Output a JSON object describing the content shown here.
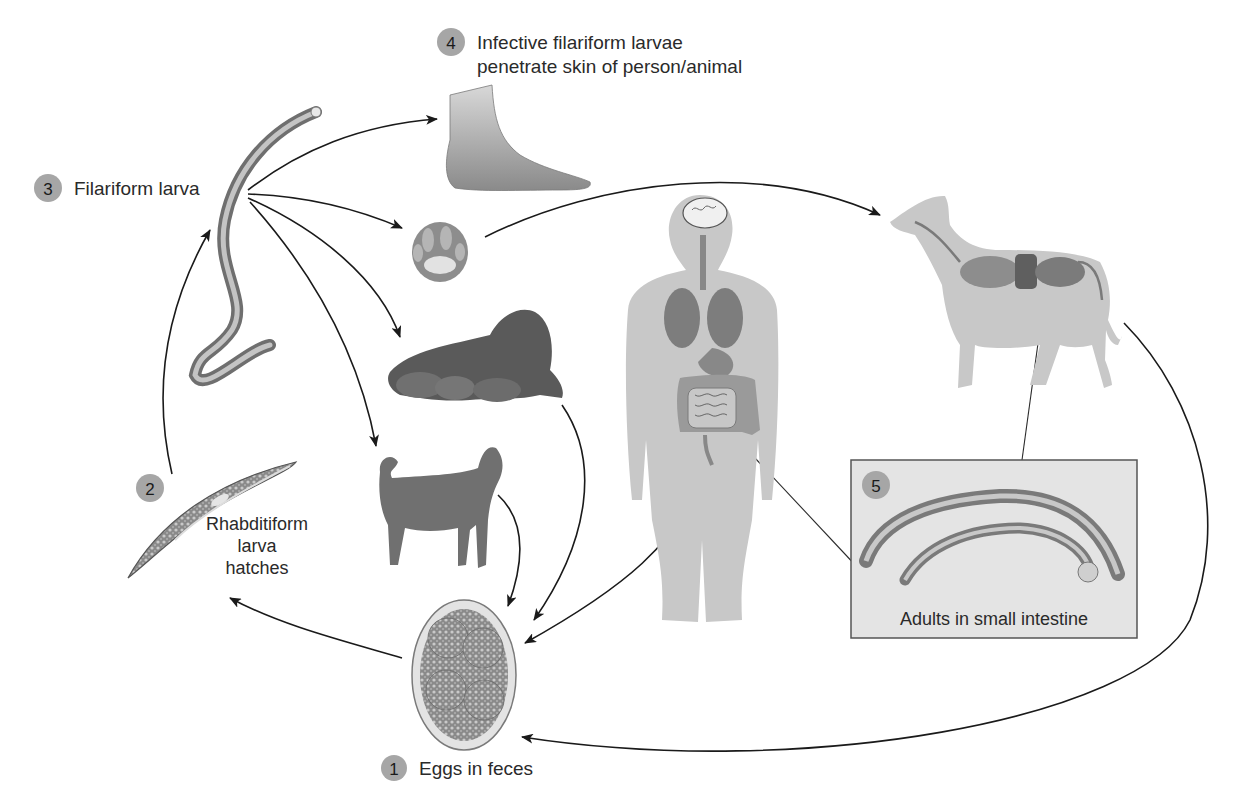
{
  "figure": {
    "colors": {
      "badge": "#a6a6a6",
      "arrow": "#1a1a1a",
      "inset_bg": "#e4e4e4",
      "silhouette": "#c8c8c8",
      "organs": "#7a7a7a"
    }
  },
  "stages": [
    {
      "number": "1",
      "label_lines": [
        "Eggs in feces"
      ],
      "icon": "egg-icon"
    },
    {
      "number": "2",
      "label_lines": [
        "Rhabditiform",
        "larva",
        "hatches"
      ],
      "icon": "rhabditiform-larva-icon"
    },
    {
      "number": "3",
      "label_lines": [
        "Filariform larva"
      ],
      "icon": "filariform-larva-icon"
    },
    {
      "number": "4",
      "label_lines": [
        "Infective filariform larvae",
        "penetrate skin of person/animal"
      ],
      "icon": "foot-icon"
    },
    {
      "number": "5",
      "label_lines": [
        "Adults in small intestine"
      ],
      "icon": "adult-worms-icon"
    }
  ],
  "hosts": [
    {
      "name": "human-foot",
      "icon": "foot-icon"
    },
    {
      "name": "dog-paw",
      "icon": "paw-icon"
    },
    {
      "name": "nursing-dog-with-puppies",
      "icon": "nursing-dog-icon"
    },
    {
      "name": "female-dog",
      "icon": "dog-icon"
    },
    {
      "name": "human-body-anatomy",
      "icon": "human-anatomy-icon"
    },
    {
      "name": "dog-anatomy",
      "icon": "dog-anatomy-icon"
    }
  ]
}
